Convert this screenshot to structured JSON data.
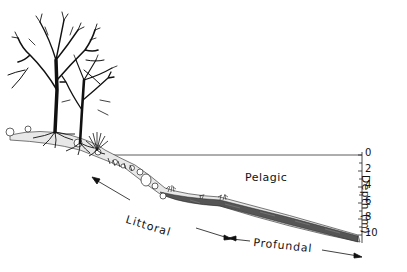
{
  "diagram": {
    "type": "lake-zonation-cross-section",
    "zones": {
      "pelagic": "Pelagic",
      "littoral": "Littoral",
      "profundal": "Profundal"
    },
    "depth_axis": {
      "label": "Depth (m)",
      "ticks": [
        "0",
        "2",
        "4",
        "6",
        "8",
        "10"
      ]
    },
    "elements": [
      "deciduous-tree-large",
      "deciduous-tree-small",
      "shrub",
      "roots",
      "shoreline-stones",
      "aquatic-plants",
      "sediment-slope",
      "water-surface-line"
    ],
    "colors": {
      "ink": "#111111",
      "sediment": "#555555",
      "background": "#ffffff"
    }
  }
}
